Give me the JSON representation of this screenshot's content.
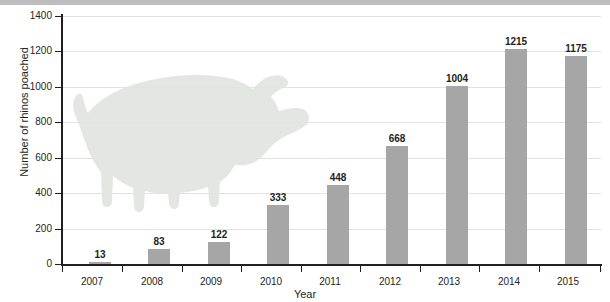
{
  "chart_data": {
    "type": "bar",
    "title": "",
    "xlabel": "Year",
    "ylabel": "Number of rhinos poached",
    "categories": [
      "2007",
      "2008",
      "2009",
      "2010",
      "2011",
      "2012",
      "2013",
      "2014",
      "2015"
    ],
    "values": [
      13,
      83,
      122,
      333,
      448,
      668,
      1004,
      1215,
      1175
    ],
    "value_labels": [
      "13",
      "83",
      "122",
      "333",
      "448",
      "668",
      "1004",
      "1215",
      "1175"
    ],
    "ylim": [
      0,
      1400
    ],
    "ytick_values": [
      0,
      200,
      400,
      600,
      800,
      1000,
      1200,
      1400
    ],
    "ytick_labels": [
      "0",
      "200",
      "400",
      "600",
      "800",
      "1000",
      "1200",
      "1400"
    ],
    "grid": true,
    "legend": false,
    "legend_position": "none",
    "bar_color": "#a6a6a6",
    "gridline_color": "#e3e3e3",
    "axis_color": "#231f20",
    "watermark_color": "#e4e6e3",
    "watermark_name": "rhino-silhouette",
    "header_strip_color": "#bdbdbd"
  }
}
